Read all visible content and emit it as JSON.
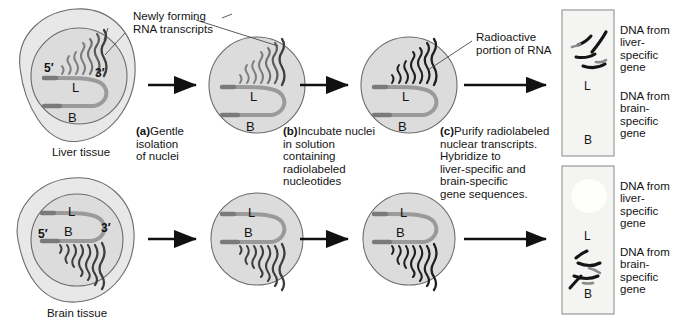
{
  "figure": {
    "colors": {
      "cytoplasm": "#e8e8e8",
      "nucleus": "#dcdcdc",
      "outline": "#6b6b6b",
      "dna_strand": "#9a9a9a",
      "transcript_light": "#7d7d7d",
      "transcript_dark": "#1e1e1e",
      "arrow": "#111111",
      "blot_fill": "#f4f4f2",
      "blot_border": "#9a9a9a",
      "band": "#141414",
      "text": "#141414"
    }
  },
  "callouts": {
    "newly_forming": "Newly forming\nRNA transcripts",
    "radioactive": "Radioactive\nportion of RNA"
  },
  "tissues": {
    "liver": "Liver tissue",
    "brain": "Brain tissue"
  },
  "gene_labels": {
    "liver_gene": "L",
    "brain_gene": "B",
    "five_prime": "5′",
    "three_prime": "3′"
  },
  "steps": [
    {
      "id": "a",
      "lead": "(a)",
      "text": "Gentle\nisolation\nof nuclei"
    },
    {
      "id": "b",
      "lead": "(b)",
      "text": "Incubate nuclei\nin solution\ncontaining\nradiolabeled\nnucleotides"
    },
    {
      "id": "c",
      "lead": "(c)",
      "text": "Purify radiolabeled\nnuclear transcripts.\nHybridize to\nliver-specific and\nbrain-specific\ngene sequences."
    }
  ],
  "blots": [
    {
      "id": "liver-blot",
      "row": "liver",
      "spot_labels": [
        "L",
        "B"
      ],
      "signal_at": "L",
      "labels": {
        "top": "DNA from\nliver-\nspecific\ngene",
        "bottom": "DNA from\nbrain-\nspecific\ngene"
      }
    },
    {
      "id": "brain-blot",
      "row": "brain",
      "spot_labels": [
        "L",
        "B"
      ],
      "signal_at": "B",
      "labels": {
        "top": "DNA from\nliver-\nspecific\ngene",
        "bottom": "DNA from\nbrain-\nspecific\ngene"
      }
    }
  ]
}
